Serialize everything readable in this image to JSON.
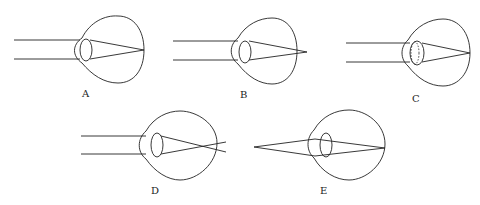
{
  "diagram": {
    "panels": [
      {
        "id": "A",
        "label": "A",
        "rays": "parallel",
        "focus": "on retina"
      },
      {
        "id": "B",
        "label": "B",
        "rays": "parallel",
        "focus": "behind retina"
      },
      {
        "id": "C",
        "label": "C",
        "rays": "parallel",
        "focus": "on retina (accommodated lens, dashed outline)"
      },
      {
        "id": "D",
        "label": "D",
        "rays": "parallel",
        "focus": "in front of retina"
      },
      {
        "id": "E",
        "label": "E",
        "rays": "diverging from near point",
        "focus": "on retina"
      }
    ]
  }
}
